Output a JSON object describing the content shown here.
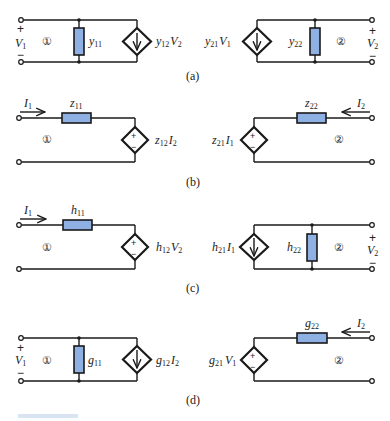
{
  "figure": {
    "colors": {
      "resistor_fill": "#8fb0e3",
      "wire": "#1a1a1a",
      "background": "#ffffff"
    },
    "panels": [
      {
        "id": "a",
        "caption": "(a)",
        "port1": {
          "number": "①",
          "plus": "+",
          "minus": "−",
          "voltage": "V",
          "voltage_sub": "1"
        },
        "port2": {
          "number": "②",
          "plus": "+",
          "minus": "−",
          "voltage": "V",
          "voltage_sub": "2"
        },
        "elements": {
          "left_resistor": {
            "sym": "y",
            "sub": "11",
            "type": "shunt-admittance"
          },
          "left_source": {
            "sym": "y",
            "sub": "12",
            "ctrl": "V",
            "ctrl_sub": "2",
            "type": "dependent-current-source"
          },
          "right_source": {
            "sym": "y",
            "sub": "21",
            "ctrl": "V",
            "ctrl_sub": "1",
            "type": "dependent-current-source"
          },
          "right_resistor": {
            "sym": "y",
            "sub": "22",
            "type": "shunt-admittance"
          }
        }
      },
      {
        "id": "b",
        "caption": "(b)",
        "port1": {
          "number": "①",
          "current": "I",
          "current_sub": "1"
        },
        "port2": {
          "number": "②",
          "current": "I",
          "current_sub": "2"
        },
        "elements": {
          "left_resistor": {
            "sym": "z",
            "sub": "11",
            "type": "series-impedance"
          },
          "left_source": {
            "sym": "z",
            "sub": "12",
            "ctrl": "I",
            "ctrl_sub": "2",
            "type": "dependent-voltage-source"
          },
          "right_source": {
            "sym": "z",
            "sub": "21",
            "ctrl": "I",
            "ctrl_sub": "1",
            "type": "dependent-voltage-source"
          },
          "right_resistor": {
            "sym": "z",
            "sub": "22",
            "type": "series-impedance"
          }
        }
      },
      {
        "id": "c",
        "caption": "(c)",
        "port1": {
          "number": "①",
          "current": "I",
          "current_sub": "1"
        },
        "port2": {
          "number": "②",
          "plus": "+",
          "minus": "−",
          "voltage": "V",
          "voltage_sub": "2"
        },
        "elements": {
          "left_resistor": {
            "sym": "h",
            "sub": "11",
            "type": "series-impedance"
          },
          "left_source": {
            "sym": "h",
            "sub": "12",
            "ctrl": "V",
            "ctrl_sub": "2",
            "type": "dependent-voltage-source"
          },
          "right_source": {
            "sym": "h",
            "sub": "21",
            "ctrl": "I",
            "ctrl_sub": "1",
            "type": "dependent-current-source"
          },
          "right_resistor": {
            "sym": "h",
            "sub": "22",
            "type": "shunt-admittance"
          }
        }
      },
      {
        "id": "d",
        "caption": "(d)",
        "port1": {
          "number": "①",
          "plus": "+",
          "minus": "−",
          "voltage": "V",
          "voltage_sub": "1"
        },
        "port2": {
          "number": "②",
          "current": "I",
          "current_sub": "2"
        },
        "elements": {
          "left_resistor": {
            "sym": "g",
            "sub": "11",
            "type": "shunt-admittance"
          },
          "left_source": {
            "sym": "g",
            "sub": "12",
            "ctrl": "I",
            "ctrl_sub": "2",
            "type": "dependent-current-source"
          },
          "right_source": {
            "sym": "g",
            "sub": "21",
            "ctrl": "V",
            "ctrl_sub": "1",
            "type": "dependent-voltage-source"
          },
          "right_resistor": {
            "sym": "g",
            "sub": "22",
            "type": "series-impedance"
          }
        }
      }
    ],
    "source_signs": {
      "plus": "+",
      "minus": "−"
    }
  }
}
